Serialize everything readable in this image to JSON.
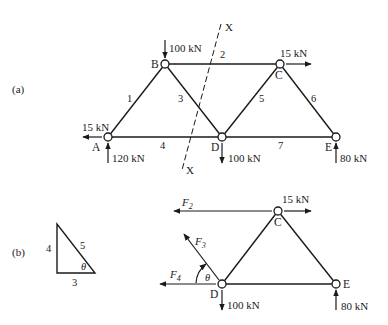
{
  "part_a": {
    "label": "(a)",
    "nodes": {
      "A": "A",
      "B": "B",
      "C": "C",
      "D": "D",
      "E": "E"
    },
    "members": [
      "1",
      "2",
      "3",
      "4",
      "5",
      "6",
      "7"
    ],
    "section_label_top": "X",
    "section_label_bottom": "X",
    "loads": {
      "B_down": "100 kN",
      "C_right": "15 kN",
      "A_left": "15 kN",
      "A_reaction": "120 kN",
      "D_down": "100 kN",
      "E_reaction": "80 kN"
    }
  },
  "part_b": {
    "label": "(b)",
    "triangle": {
      "vertical": "4",
      "hypotenuse": "5",
      "base": "3",
      "angle": "θ"
    },
    "nodes": {
      "C": "C",
      "D": "D",
      "E": "E"
    },
    "forces": {
      "F2": {
        "letter": "F",
        "sub": "2"
      },
      "F3": {
        "letter": "F",
        "sub": "3"
      },
      "F4": {
        "letter": "F",
        "sub": "4"
      }
    },
    "angle_label": "θ",
    "loads": {
      "C_right": "15 kN",
      "D_down": "100 kN",
      "E_reaction": "80 kN"
    }
  }
}
